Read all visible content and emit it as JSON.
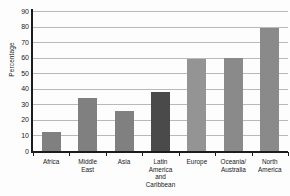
{
  "chart_data": {
    "type": "bar",
    "title": "",
    "xlabel": "",
    "ylabel": "Percentage",
    "ylim": [
      0,
      90
    ],
    "ytick_step": 10,
    "yticks": [
      0,
      10,
      20,
      30,
      40,
      50,
      60,
      70,
      80,
      90
    ],
    "grid": true,
    "legend": false,
    "categories": [
      "Africa",
      "Middle East",
      "Asia",
      "Latin America and Caribbean",
      "Europe",
      "Oceania/Australia",
      "North America"
    ],
    "category_label_lines": [
      [
        "Africa"
      ],
      [
        "Middle",
        "East"
      ],
      [
        "Asia"
      ],
      [
        "Latin",
        "America",
        "and",
        "Caribbean"
      ],
      [
        "Europe"
      ],
      [
        "Oceania/",
        "Australia"
      ],
      [
        "North",
        "America"
      ]
    ],
    "values": [
      12,
      34,
      26,
      38,
      59,
      60,
      79
    ],
    "bar_colors": [
      "#808080",
      "#808080",
      "#808080",
      "#4a4a4a",
      "#949494",
      "#8a8a8a",
      "#8a8a8a"
    ],
    "highlight_category": "Latin America and Caribbean",
    "highlight_color": "#4a4a4a",
    "default_bar_color": "#808080",
    "axis_color": "#1c1c1c",
    "gridline_color": "#b9b9b9",
    "background_color": "#fdfdfd"
  }
}
